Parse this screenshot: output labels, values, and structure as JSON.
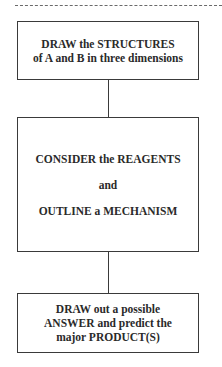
{
  "diagram": {
    "type": "flowchart",
    "orientation": "vertical",
    "steps": [
      {
        "lines": [
          "DRAW the STRUCTURES",
          "of A and B in three dimensions"
        ]
      },
      {
        "lines": [
          "CONSIDER the REAGENTS",
          "and",
          "OUTLINE a MECHANISM"
        ]
      },
      {
        "lines": [
          "DRAW out a possible",
          "ANSWER and predict the",
          "major PRODUCT(S)"
        ]
      }
    ],
    "connectors": [
      {
        "from": 0,
        "to": 1
      },
      {
        "from": 1,
        "to": 2
      }
    ],
    "colors": {
      "border": "#3a3a3a",
      "text": "#2a2a2a",
      "background": "#ffffff"
    }
  }
}
